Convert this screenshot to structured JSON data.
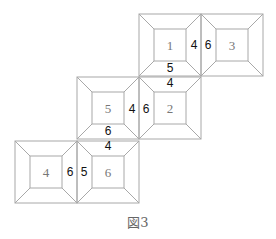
{
  "figure": {
    "caption": "図3",
    "squares": [
      {
        "id": "sq-1",
        "center_label": "1",
        "x": 139,
        "y": 14
      },
      {
        "id": "sq-3",
        "center_label": "3",
        "x": 201,
        "y": 14
      },
      {
        "id": "sq-2",
        "center_label": "2",
        "x": 139,
        "y": 77
      },
      {
        "id": "sq-5",
        "center_label": "5",
        "x": 77,
        "y": 77
      },
      {
        "id": "sq-6",
        "center_label": "6",
        "x": 77,
        "y": 141
      },
      {
        "id": "sq-4",
        "center_label": "4",
        "x": 15,
        "y": 141
      }
    ],
    "square_size": 62,
    "inset": 15,
    "edge_labels": [
      {
        "text": "4",
        "x": 194,
        "y": 49
      },
      {
        "text": "6",
        "x": 208,
        "y": 49
      },
      {
        "text": "5",
        "x": 170,
        "y": 72
      },
      {
        "text": "4",
        "x": 170,
        "y": 87
      },
      {
        "text": "4",
        "x": 132,
        "y": 113
      },
      {
        "text": "6",
        "x": 146,
        "y": 113
      },
      {
        "text": "6",
        "x": 108,
        "y": 135
      },
      {
        "text": "4",
        "x": 108,
        "y": 150
      },
      {
        "text": "6",
        "x": 70,
        "y": 176
      },
      {
        "text": "5",
        "x": 84,
        "y": 176
      }
    ]
  }
}
